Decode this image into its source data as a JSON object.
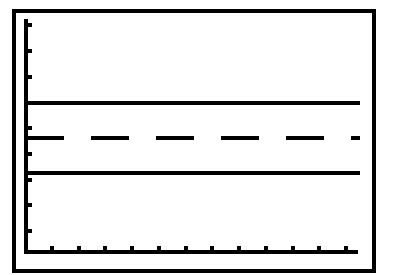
{
  "screen": {
    "type": "graphing-calculator-display",
    "colors": {
      "background": "#ffffff",
      "ink": "#000000"
    }
  },
  "frame": {
    "x": 14,
    "y": 11,
    "width": 360,
    "height": 260,
    "stroke_width": 4
  },
  "axes": {
    "origin": {
      "x": 26,
      "y": 252
    },
    "y_axis": {
      "x": 26,
      "top": 19,
      "bottom": 252,
      "ticks_y": [
        25,
        51,
        77,
        128,
        154,
        180,
        205,
        231
      ]
    },
    "x_axis": {
      "y": 252,
      "left": 26,
      "right": 358,
      "ticks_x": [
        52,
        79,
        105,
        132,
        159,
        186,
        212,
        239,
        266,
        293,
        319,
        346
      ]
    }
  },
  "lines": [
    {
      "name": "upper-solid-line",
      "style": "solid",
      "y": 103,
      "x1": 26,
      "x2": 360
    },
    {
      "name": "middle-dashed-line",
      "style": "dashed",
      "y": 138,
      "x1": 26,
      "x2": 360,
      "dash": 38,
      "gap": 27
    },
    {
      "name": "lower-solid-line",
      "style": "solid",
      "y": 173,
      "x1": 26,
      "x2": 360
    }
  ]
}
